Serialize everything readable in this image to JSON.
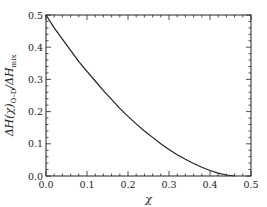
{
  "chart_data": {
    "type": "line",
    "title": "",
    "xlabel": "χ",
    "ylabel_parts": {
      "main": "ΔH(χ)",
      "sub": "O–D",
      "mid": "/ΔH",
      "sub2": "mix"
    },
    "xlim": [
      0.0,
      0.5
    ],
    "ylim": [
      0.0,
      0.5
    ],
    "xticks": [
      "0.0",
      "0.1",
      "0.2",
      "0.3",
      "0.4",
      "0.5"
    ],
    "yticks": [
      "0.0",
      "0.1",
      "0.2",
      "0.3",
      "0.4",
      "0.5"
    ],
    "grid": false,
    "series": [
      {
        "name": "ΔH(χ)O-D/ΔHmix",
        "color": "#222222",
        "x": [
          0.0,
          0.02,
          0.04,
          0.06,
          0.08,
          0.1,
          0.12,
          0.14,
          0.16,
          0.18,
          0.2,
          0.22,
          0.24,
          0.26,
          0.28,
          0.3,
          0.32,
          0.34,
          0.36,
          0.38,
          0.4,
          0.42,
          0.44,
          0.46
        ],
        "y": [
          0.5,
          0.46,
          0.425,
          0.39,
          0.355,
          0.325,
          0.295,
          0.265,
          0.238,
          0.21,
          0.185,
          0.162,
          0.14,
          0.12,
          0.1,
          0.082,
          0.066,
          0.052,
          0.039,
          0.027,
          0.017,
          0.009,
          0.003,
          0.0
        ]
      }
    ]
  }
}
